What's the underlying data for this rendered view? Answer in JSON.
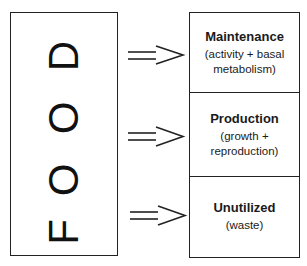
{
  "source": {
    "label": "FOOD",
    "letters": [
      "D",
      "O",
      "O",
      "F"
    ]
  },
  "arrow_symbol": "double-arrow",
  "categories": [
    {
      "title": "Maintenance",
      "subtitle_line1": "(activity + basal",
      "subtitle_line2": "metabolism)"
    },
    {
      "title": "Production",
      "subtitle_line1": "(growth +",
      "subtitle_line2": "reproduction)"
    },
    {
      "title": "Unutilized",
      "subtitle_line1": "(waste)",
      "subtitle_line2": ""
    }
  ],
  "colors": {
    "line": "#222222",
    "text": "#1a1a1a",
    "background": "#ffffff"
  }
}
